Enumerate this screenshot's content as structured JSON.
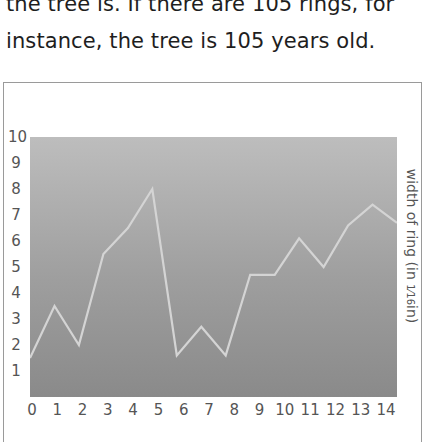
{
  "text": {
    "line1": "the tree is. If there are 105 rings, for",
    "line2": "instance, the tree is 105 years old."
  },
  "chart_data": {
    "type": "line",
    "title": "",
    "xlabel": "",
    "ylabel": "width of ring (in 1/16in)",
    "ylabel_parts": {
      "prefix": "width of ring (in ",
      "fraction": "1⁄16",
      "suffix": "in)"
    },
    "x_ticks": [
      "0",
      "1",
      "2",
      "3",
      "4",
      "5",
      "6",
      "7",
      "8",
      "9",
      "10",
      "11",
      "12",
      "13",
      "14"
    ],
    "y_ticks": [
      "1",
      "2",
      "3",
      "4",
      "5",
      "6",
      "7",
      "8",
      "9",
      "10"
    ],
    "ylim": [
      0,
      10
    ],
    "xlim": [
      0,
      15
    ],
    "grid": false,
    "legend": null,
    "series": [
      {
        "name": "ring width",
        "x": [
          0,
          1,
          2,
          3,
          4,
          5,
          6,
          7,
          8,
          9,
          10,
          11,
          12,
          13,
          14,
          15
        ],
        "values": [
          1.5,
          3.5,
          2.0,
          5.5,
          6.5,
          8.0,
          1.6,
          2.7,
          1.6,
          4.7,
          4.7,
          6.1,
          5.0,
          6.6,
          7.4,
          6.7
        ]
      }
    ],
    "colors": {
      "line": "#d4d4d4",
      "plot_top": "#bdbdbd",
      "plot_bottom": "#8a8a8a",
      "frame": "#9a9a9a"
    }
  }
}
